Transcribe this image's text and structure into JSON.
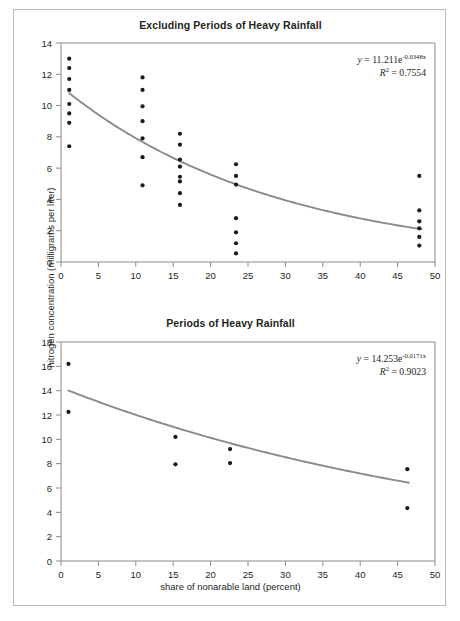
{
  "figure": {
    "shared_y_axis_label": "nitrogen concentration (milligrams per liter)",
    "shared_x_axis_label": "share of nonarable land (percent)",
    "border_color": "#b9b9b9",
    "point_color": "#1a1a1a",
    "curve_color": "#8a8a8a",
    "axis_color": "#8a8a8a"
  },
  "chart_data": [
    {
      "type": "scatter",
      "title": "Excluding Periods of Heavy Rainfall",
      "xlabel": "",
      "ylabel": "nitrogen concentration (milligrams per liter)",
      "xlim": [
        0,
        50
      ],
      "ylim": [
        0,
        14
      ],
      "xticks": [
        0,
        5,
        10,
        15,
        20,
        25,
        30,
        35,
        40,
        45,
        50
      ],
      "yticks": [
        0,
        2,
        4,
        6,
        8,
        10,
        12,
        14
      ],
      "grid": false,
      "legend": null,
      "annotation_equation": "y = 11.211e",
      "annotation_exponent": "-0.0348x",
      "annotation_r2_label": "R",
      "annotation_r2_sup": "2",
      "annotation_r2_value": " = 0.7554",
      "trendline": {
        "kind": "exponential",
        "a": 11.211,
        "b": -0.0348,
        "r2": 0.7554,
        "x_start": 1.1,
        "x_end": 48.2
      },
      "points": [
        {
          "x": 1.1,
          "y": 13.0
        },
        {
          "x": 1.1,
          "y": 12.4
        },
        {
          "x": 1.1,
          "y": 11.7
        },
        {
          "x": 1.1,
          "y": 11.0
        },
        {
          "x": 1.1,
          "y": 10.1
        },
        {
          "x": 1.1,
          "y": 9.5
        },
        {
          "x": 1.1,
          "y": 8.9
        },
        {
          "x": 1.1,
          "y": 7.4
        },
        {
          "x": 10.9,
          "y": 11.8
        },
        {
          "x": 10.9,
          "y": 11.0
        },
        {
          "x": 10.9,
          "y": 9.95
        },
        {
          "x": 10.9,
          "y": 9.0
        },
        {
          "x": 10.9,
          "y": 7.9
        },
        {
          "x": 10.9,
          "y": 6.7
        },
        {
          "x": 10.9,
          "y": 4.9
        },
        {
          "x": 15.9,
          "y": 8.2
        },
        {
          "x": 15.9,
          "y": 7.5
        },
        {
          "x": 15.9,
          "y": 6.55
        },
        {
          "x": 15.9,
          "y": 6.1
        },
        {
          "x": 15.9,
          "y": 5.45
        },
        {
          "x": 15.9,
          "y": 5.15
        },
        {
          "x": 15.9,
          "y": 4.4
        },
        {
          "x": 15.9,
          "y": 3.65
        },
        {
          "x": 23.4,
          "y": 6.25
        },
        {
          "x": 23.4,
          "y": 5.5
        },
        {
          "x": 23.4,
          "y": 4.95
        },
        {
          "x": 23.4,
          "y": 2.8
        },
        {
          "x": 23.4,
          "y": 1.9
        },
        {
          "x": 23.4,
          "y": 1.2
        },
        {
          "x": 23.4,
          "y": 0.55
        },
        {
          "x": 47.9,
          "y": 5.5
        },
        {
          "x": 47.9,
          "y": 3.3
        },
        {
          "x": 47.9,
          "y": 2.6
        },
        {
          "x": 47.9,
          "y": 2.15
        },
        {
          "x": 47.9,
          "y": 1.6
        },
        {
          "x": 47.9,
          "y": 1.05
        }
      ]
    },
    {
      "type": "scatter",
      "title": "Periods of Heavy Rainfall",
      "xlabel": "share of nonarable land (percent)",
      "ylabel": "nitrogen concentration (milligrams per liter)",
      "xlim": [
        0,
        50
      ],
      "ylim": [
        0,
        18
      ],
      "xticks": [
        0,
        5,
        10,
        15,
        20,
        25,
        30,
        35,
        40,
        45,
        50
      ],
      "yticks": [
        0,
        2,
        4,
        6,
        8,
        10,
        12,
        14,
        16,
        18
      ],
      "grid": false,
      "legend": null,
      "annotation_equation": "y = 14.253e",
      "annotation_exponent": "-0.0171x",
      "annotation_r2_label": "R",
      "annotation_r2_sup": "2",
      "annotation_r2_value": " = 0.9023",
      "trendline": {
        "kind": "exponential",
        "a": 14.253,
        "b": -0.0171,
        "r2": 0.9023,
        "x_start": 1.0,
        "x_end": 46.5
      },
      "points": [
        {
          "x": 1.0,
          "y": 16.2
        },
        {
          "x": 1.0,
          "y": 12.25
        },
        {
          "x": 15.3,
          "y": 10.2
        },
        {
          "x": 15.3,
          "y": 7.95
        },
        {
          "x": 22.6,
          "y": 9.2
        },
        {
          "x": 22.6,
          "y": 8.05
        },
        {
          "x": 46.3,
          "y": 7.55
        },
        {
          "x": 46.3,
          "y": 4.35
        }
      ]
    }
  ]
}
